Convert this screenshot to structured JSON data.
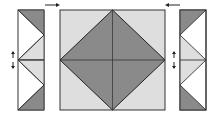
{
  "diagram": {
    "colors": {
      "dark": "#8a8a8a",
      "light": "#dedede",
      "white": "#ffffff",
      "outline": "#333333",
      "arrow": "#222222"
    },
    "main_square": {
      "x": 60,
      "y": 10,
      "size": 105
    },
    "left_strip": {
      "x": 18,
      "y": 10,
      "width": 26,
      "height": 100
    },
    "right_strip": {
      "x": 180,
      "y": 10,
      "width": 26,
      "height": 100
    },
    "arrows": [
      {
        "name": "top-left-arrow",
        "direction": "right"
      },
      {
        "name": "top-right-arrow",
        "direction": "left"
      },
      {
        "name": "left-fold-arrow",
        "direction": "up-down"
      },
      {
        "name": "right-fold-arrow",
        "direction": "up-down"
      }
    ]
  }
}
